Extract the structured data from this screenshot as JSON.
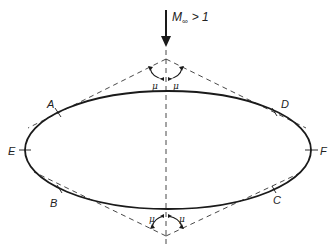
{
  "figure": {
    "freestream_label": "M∞ > 1",
    "mach_symbol": "M",
    "mach_subscript": "∞",
    "mach_condition": "> 1",
    "mach_angle_symbol": "μ",
    "points": [
      {
        "id": "A",
        "label": "A"
      },
      {
        "id": "B",
        "label": "B"
      },
      {
        "id": "C",
        "label": "C"
      },
      {
        "id": "D",
        "label": "D"
      },
      {
        "id": "E",
        "label": "E"
      },
      {
        "id": "F",
        "label": "F"
      }
    ],
    "colors": {
      "line": "#1a1a1a",
      "background": "#ffffff"
    }
  }
}
